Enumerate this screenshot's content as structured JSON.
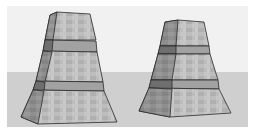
{
  "scene": {
    "description": "3D render of two textured stone pedestals (tapered, banded) on a ground plane",
    "colors": {
      "border": "#ffffff",
      "sky": "#f1f1f1",
      "ground": "#cfcfcf",
      "edge": "#2a2a2a",
      "face_front": "#b9b9b9",
      "face_side": "#8f8f8f",
      "band_front": "#a2a2a2",
      "band_side": "#6f6f6f"
    },
    "objects": [
      {
        "name": "left-pedestal",
        "sections": 3
      },
      {
        "name": "right-pedestal",
        "sections": 3
      }
    ]
  }
}
